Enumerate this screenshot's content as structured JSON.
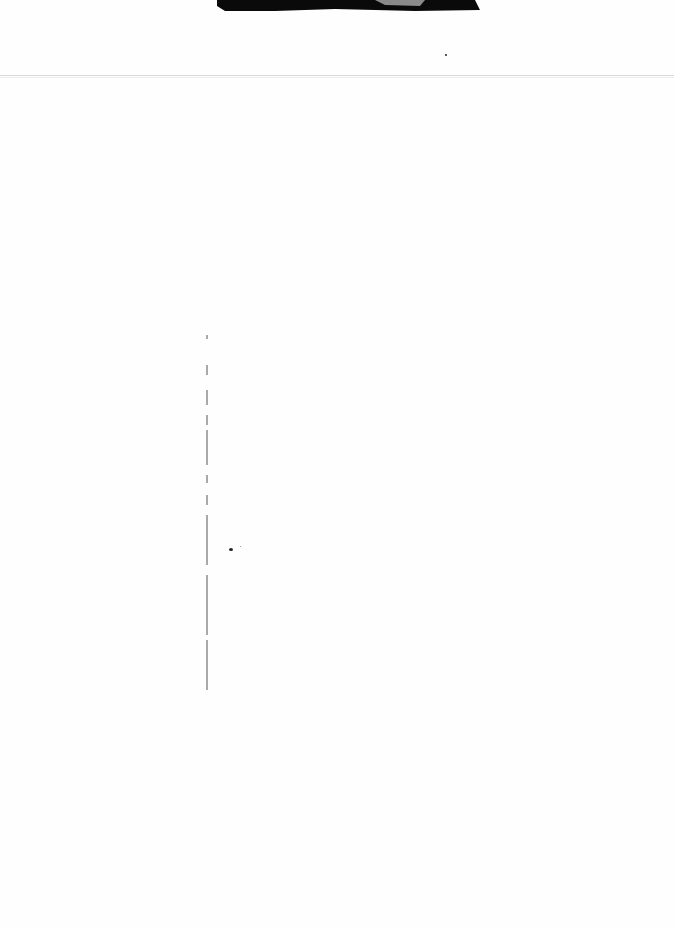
{
  "document": {
    "type": "scanned blank page",
    "text": ""
  }
}
